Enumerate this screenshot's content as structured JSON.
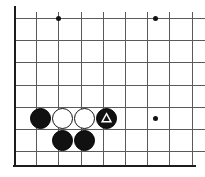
{
  "figure": {
    "kind": "go-board-diagram",
    "width": 205,
    "height": 177,
    "background_color": "#ffffff"
  },
  "board": {
    "grid_origin_x": 14,
    "grid_origin_y": 18,
    "grid_spacing": 22.2,
    "columns": 9,
    "rows": 7,
    "line_color": "#5a5a5a",
    "edge_color": "#1c1c1c",
    "edge_line_width": 2,
    "grid_line_width": 1,
    "left_edge_x": 14,
    "bottom_edge_y": 165,
    "left_edge_top": 6,
    "left_edge_bottom": 167,
    "bottom_edge_left": 13,
    "bottom_edge_right": 196,
    "verticals": [
      14,
      36.2,
      58.4,
      80.6,
      102.8,
      125,
      147.2,
      169.4,
      191.6
    ],
    "verticals_top": 12,
    "verticals_bottom": 165,
    "horizontals": [
      18,
      40.2,
      62.4,
      84.6,
      106.8,
      129,
      151.2
    ],
    "horizontals_left": 14,
    "horizontals_right": 205
  },
  "star_points": [
    {
      "name": "star-point-top-left",
      "x": 58,
      "y": 18
    },
    {
      "name": "star-point-top-right",
      "x": 155,
      "y": 18
    },
    {
      "name": "star-point-right",
      "x": 155,
      "y": 118
    }
  ],
  "stones": [
    {
      "name": "black-stone-left",
      "color": "black",
      "x": 40,
      "y": 118,
      "marker": "none"
    },
    {
      "name": "white-stone-left",
      "color": "white",
      "x": 62,
      "y": 118,
      "marker": "none"
    },
    {
      "name": "white-stone-right",
      "color": "white",
      "x": 84,
      "y": 118,
      "marker": "none"
    },
    {
      "name": "black-stone-marked",
      "color": "black",
      "x": 106,
      "y": 118,
      "marker": "triangle"
    },
    {
      "name": "black-stone-below-left",
      "color": "black",
      "x": 62,
      "y": 140,
      "marker": "none"
    },
    {
      "name": "black-stone-below-right",
      "color": "black",
      "x": 84,
      "y": 140,
      "marker": "none"
    }
  ],
  "colors": {
    "black_stone": "#111111",
    "white_stone": "#ffffff",
    "stone_outline": "#111111",
    "marker_stroke": "#ffffff",
    "grid": "#5a5a5a",
    "edge": "#1c1c1c"
  }
}
